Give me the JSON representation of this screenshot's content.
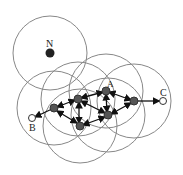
{
  "labels": {
    "N": "N",
    "A": "A",
    "B": "B",
    "C": "C"
  },
  "nodes": [
    {
      "id": "N",
      "x": 50,
      "y": 53,
      "r": 37,
      "type": "isolated"
    },
    {
      "id": "n1",
      "x": 54,
      "y": 108,
      "r": 37,
      "type": "relay"
    },
    {
      "id": "n2",
      "x": 78,
      "y": 99,
      "r": 37,
      "type": "relay"
    },
    {
      "id": "A",
      "x": 106,
      "y": 91,
      "r": 37,
      "type": "relay"
    },
    {
      "id": "n4",
      "x": 134,
      "y": 101,
      "r": 37,
      "type": "relay"
    },
    {
      "id": "n5",
      "x": 108,
      "y": 115,
      "r": 37,
      "type": "relay"
    },
    {
      "id": "n6",
      "x": 80,
      "y": 126,
      "r": 37,
      "type": "relay"
    },
    {
      "id": "B",
      "x": 32,
      "y": 118,
      "type": "endpoint"
    },
    {
      "id": "C",
      "x": 163,
      "y": 101,
      "type": "endpoint"
    }
  ],
  "colors": {
    "circle": "#888888",
    "node": "#555555",
    "edge": "#111111"
  }
}
